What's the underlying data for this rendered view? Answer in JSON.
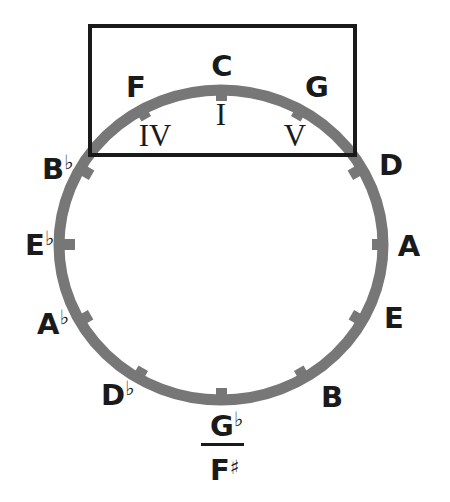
{
  "diagram": {
    "colors": {
      "ring": "#777777",
      "box": "#1a1a1a",
      "text": "#1a1a1a",
      "background": "#ffffff"
    },
    "notes": [
      {
        "id": "c",
        "letter": "C",
        "accidental": "",
        "angle_deg": 0
      },
      {
        "id": "g",
        "letter": "G",
        "accidental": "",
        "angle_deg": 30
      },
      {
        "id": "d",
        "letter": "D",
        "accidental": "",
        "angle_deg": 60
      },
      {
        "id": "a",
        "letter": "A",
        "accidental": "",
        "angle_deg": 90
      },
      {
        "id": "e",
        "letter": "E",
        "accidental": "",
        "angle_deg": 120
      },
      {
        "id": "b",
        "letter": "B",
        "accidental": "",
        "angle_deg": 150
      },
      {
        "id": "g-flat",
        "letter": "G",
        "accidental": "♭",
        "angle_deg": 180
      },
      {
        "id": "d-flat",
        "letter": "D",
        "accidental": "♭",
        "angle_deg": 210
      },
      {
        "id": "a-flat",
        "letter": "A",
        "accidental": "♭",
        "angle_deg": 240
      },
      {
        "id": "e-flat",
        "letter": "E",
        "accidental": "♭",
        "angle_deg": 270
      },
      {
        "id": "b-flat",
        "letter": "B",
        "accidental": "♭",
        "angle_deg": 300
      },
      {
        "id": "f",
        "letter": "F",
        "accidental": "",
        "angle_deg": 330
      }
    ],
    "enharmonic": {
      "letter": "F",
      "accidental": "♯"
    },
    "highlight_box": {
      "label": "I, IV, V region",
      "numerals": [
        {
          "id": "iv",
          "text": "IV",
          "note": "F"
        },
        {
          "id": "i",
          "text": "I",
          "note": "C"
        },
        {
          "id": "v",
          "text": "V",
          "note": "G"
        }
      ]
    }
  }
}
